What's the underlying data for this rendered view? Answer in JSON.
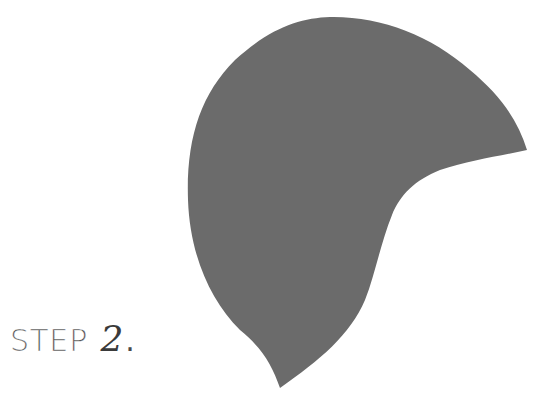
{
  "step": {
    "word": "STEP",
    "number": "2",
    "suffix": "."
  },
  "shape": {
    "name": "hat-pattern-piece",
    "fill": "#6b6b6b",
    "background": "#ffffff"
  },
  "colors": {
    "text": "#4a4a4a",
    "shape": "#6b6b6b",
    "background": "#ffffff"
  }
}
